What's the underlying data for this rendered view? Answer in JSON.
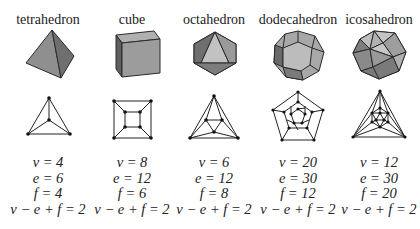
{
  "figure": {
    "solids": [
      {
        "name": "tetrahedron",
        "v": "v = 4",
        "e": "e = 6",
        "f": "f = 4",
        "euler": "v − e + f = 2"
      },
      {
        "name": "cube",
        "v": "v = 8",
        "e": "e = 12",
        "f": "f = 6",
        "euler": "v − e + f = 2"
      },
      {
        "name": "octahedron",
        "v": "v = 6",
        "e": "e = 12",
        "f": "f = 8",
        "euler": "v − e + f = 2"
      },
      {
        "name": "dodecahedron",
        "v": "v = 20",
        "e": "e = 30",
        "f": "f = 12",
        "euler": "v − e + f = 2"
      },
      {
        "name": "icosahedron",
        "v": "v = 12",
        "e": "e = 30",
        "f": "f = 20",
        "euler": "v − e + f = 2"
      }
    ],
    "colors": {
      "face_light": "#b8b8b8",
      "face_mid": "#9a9a9a",
      "face_dark": "#6e6e6e",
      "edge": "#2a2a2a"
    }
  }
}
